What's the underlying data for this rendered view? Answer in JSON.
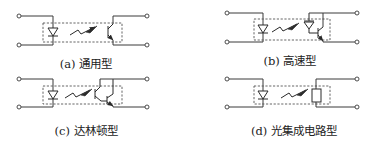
{
  "figure": {
    "panels": [
      {
        "id": "a",
        "label": "(a) 通用型",
        "type": "general-purpose phototransistor optocoupler"
      },
      {
        "id": "b",
        "label": "(b) 高速型",
        "type": "high-speed photodiode-transistor optocoupler"
      },
      {
        "id": "c",
        "label": "(c) 达林顿型",
        "type": "darlington optocoupler"
      },
      {
        "id": "d",
        "label": "(d) 光集成电路型",
        "type": "photo integrated circuit optocoupler"
      }
    ]
  }
}
